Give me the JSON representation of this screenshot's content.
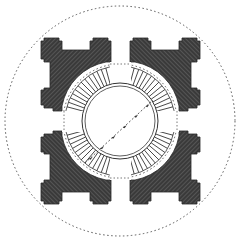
{
  "diagram": {
    "type": "architectural-plan",
    "canvas": {
      "width": 241,
      "height": 241,
      "background": "#ffffff"
    },
    "center": [
      120,
      121
    ],
    "outer_dotted_circle": {
      "r": 115,
      "stroke": "#555555"
    },
    "inner_dotted_circle": {
      "r": 57,
      "stroke": "#555555"
    },
    "radial_ring": {
      "r_outer": 55,
      "r_inner": 38,
      "spokes": 72,
      "stroke": "#333333"
    },
    "inner_double_circle": {
      "r1": 38,
      "r2": 35,
      "stroke": "#333333"
    },
    "piers": {
      "count": 4,
      "fill": "#3a3a3a",
      "hatch": "#6a6a6a"
    },
    "diagonal_axis": {
      "from": [
        85,
        163
      ],
      "to": [
        153,
        100
      ],
      "markers": 6,
      "stroke": "#333333"
    },
    "colors": {
      "ink": "#333333",
      "pier_fill": "#3a3a3a",
      "hatch": "#707070",
      "paper": "#ffffff"
    }
  }
}
